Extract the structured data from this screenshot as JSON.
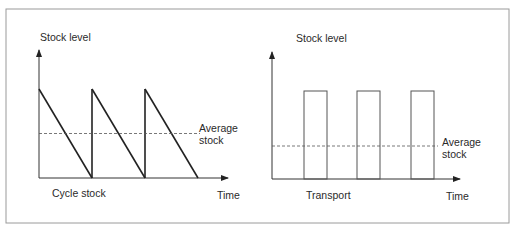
{
  "chart_data": [
    {
      "type": "line",
      "title": "Cycle stock",
      "xlabel": "Time",
      "ylabel": "Stock level",
      "pattern": "sawtooth",
      "cycles": 3,
      "series": [
        {
          "name": "Stock level",
          "x": [
            0,
            0,
            1,
            1,
            1,
            2,
            2,
            2,
            3
          ],
          "y": [
            0,
            1,
            0,
            1,
            0,
            0,
            1,
            0,
            0
          ]
        }
      ],
      "series_points": [
        [
          0,
          1
        ],
        [
          1,
          0
        ],
        [
          1,
          1
        ],
        [
          2,
          0
        ],
        [
          2,
          1
        ],
        [
          3,
          0
        ]
      ],
      "average": {
        "label_line1": "Average",
        "label_line2": "stock",
        "value": 0.5
      },
      "xlim": [
        0,
        3.6
      ],
      "ylim": [
        0,
        1.7
      ]
    },
    {
      "type": "line",
      "title": "Transport",
      "xlabel": "Time",
      "ylabel": "Stock level",
      "pattern": "pulses",
      "pulses": [
        {
          "start": 1,
          "end": 1.5
        },
        {
          "start": 2.2,
          "end": 2.7
        },
        {
          "start": 3.4,
          "end": 3.9
        }
      ],
      "pulse_height": 1,
      "average": {
        "label_line1": "Average",
        "label_line2": "stock",
        "value": 0.37
      },
      "xlim": [
        0,
        4.8
      ],
      "ylim": [
        0,
        1.65
      ]
    }
  ]
}
